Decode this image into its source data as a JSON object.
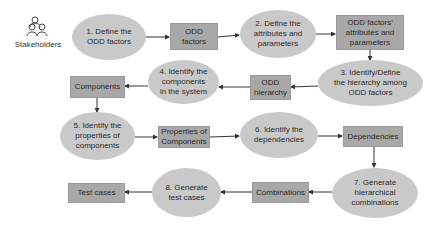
{
  "diagram": {
    "actor": {
      "label": "Stakeholders",
      "icon": "people-group-icon"
    },
    "steps": [
      {
        "id": 1,
        "label": "1. Define the ODD factors"
      },
      {
        "id": 2,
        "label": "2. Define the attributes and parameters"
      },
      {
        "id": 3,
        "label": "3. Identify/Define the hierarchy among ODD factors"
      },
      {
        "id": 4,
        "label": "4. Identify the components in the system"
      },
      {
        "id": 5,
        "label": "5. Identify the properties of components"
      },
      {
        "id": 6,
        "label": "6. Identify the dependencies"
      },
      {
        "id": 7,
        "label": "7. Generate hierarchical combinations"
      },
      {
        "id": 8,
        "label": "8. Generate test cases"
      }
    ],
    "artifacts": [
      {
        "label": "ODD factors"
      },
      {
        "label": "ODD factors' attributes and parameters"
      },
      {
        "label": "ODD hierarchy"
      },
      {
        "label": "Components"
      },
      {
        "label": "Properties of Components"
      },
      {
        "label": "Dependencies"
      },
      {
        "label": "Combinations"
      },
      {
        "label": "Test cases"
      }
    ],
    "colors": {
      "process": "#c9c9c9",
      "artifact": "#a8a8a8",
      "arrow": "#333333"
    }
  }
}
